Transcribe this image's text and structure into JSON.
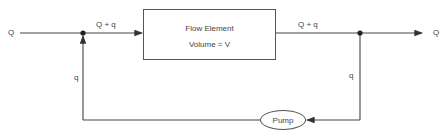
{
  "diagram": {
    "type": "flow-recycle-block-diagram",
    "inlet_label": "Q",
    "outlet_label": "Q",
    "forward_flow_in_label": "Q + q",
    "forward_flow_out_label": "Q + q",
    "recycle_left_label": "q",
    "recycle_right_label": "q",
    "flow_element": {
      "title": "Flow Element",
      "volume": "Volume = V"
    },
    "pump_label": "Pump",
    "line_color": "#444444"
  }
}
